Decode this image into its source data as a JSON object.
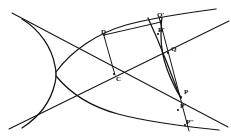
{
  "figure": {
    "ink_color": "#111111",
    "background_color": "#ffffff",
    "curve_stroke_width": 1.1,
    "line_stroke_width": 1.0,
    "labels": [
      {
        "name": "label-d",
        "text": "D",
        "x": 101,
        "y": 29
      },
      {
        "name": "label-c",
        "text": "C",
        "x": 116,
        "y": 76
      },
      {
        "name": "label-qp",
        "text": "Q'",
        "x": 157,
        "y": 13
      },
      {
        "name": "label-rp",
        "text": "R'",
        "x": 158,
        "y": 28
      },
      {
        "name": "label-q",
        "text": "Q",
        "x": 171,
        "y": 46
      },
      {
        "name": "label-p",
        "text": "P",
        "x": 184,
        "y": 90
      },
      {
        "name": "label-pp",
        "text": "P'",
        "x": 180,
        "y": 104
      },
      {
        "name": "label-ppp",
        "text": "P''",
        "x": 186,
        "y": 120
      }
    ],
    "points": {
      "center": {
        "label": "C",
        "x": 114,
        "y": 74
      },
      "d": {
        "label": "D",
        "x": 104,
        "y": 36
      },
      "q_prime": {
        "label": "Q'",
        "x": 160,
        "y": 21
      },
      "r_prime": {
        "label": "R'",
        "x": 157,
        "y": 35
      },
      "q": {
        "label": "Q",
        "x": 168,
        "y": 53
      },
      "p": {
        "label": "P",
        "x": 181,
        "y": 97
      },
      "p_prime": {
        "label": "P'",
        "x": 178,
        "y": 110
      },
      "p_double": {
        "label": "P''",
        "x": 185,
        "y": 126
      }
    },
    "geometry": {
      "asymptote_upper": {
        "name": "asymptote-upper-left-to-lower-right",
        "x1": 14,
        "y1": 14,
        "x2": 228,
        "y2": 126
      },
      "asymptote_lower": {
        "name": "asymptote-lower-left-to-upper-right",
        "x1": 10,
        "y1": 128,
        "x2": 228,
        "y2": 22
      },
      "secant": {
        "name": "secant-line",
        "x1": 160,
        "y1": 19,
        "x2": 188,
        "y2": 130
      },
      "chord_d_c": {
        "name": "chord-d-to-c",
        "x1": 104,
        "y1": 36,
        "x2": 114,
        "y2": 74
      },
      "chord_d_qprime": {
        "name": "chord-d-to-q-prime",
        "x1": 104,
        "y1": 36,
        "x2": 161,
        "y2": 22
      },
      "left_branch_vertex": {
        "x": 48,
        "y": 73
      },
      "right_branch_vertex": {
        "x": 180,
        "y": 74
      }
    }
  }
}
